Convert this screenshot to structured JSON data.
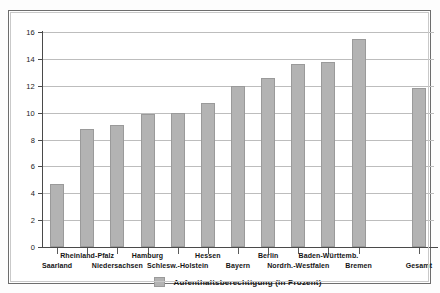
{
  "chart_data": {
    "type": "bar",
    "title": "",
    "subtitle": "",
    "xlabel": "",
    "ylabel": "",
    "ylim": [
      0,
      16
    ],
    "ytick_step": 2,
    "yticks": [
      0,
      2,
      4,
      6,
      8,
      10,
      12,
      14,
      16
    ],
    "grid": true,
    "legend_position": "bottom",
    "legend": [
      "Aufenthaltsberechtigung (in Prozent)"
    ],
    "series_color": "#b3b3b3",
    "categories": [
      "Saarland",
      "Rheinland-Pfalz",
      "Niedersachsen",
      "Hamburg",
      "Schlesw.-Holstein",
      "Hessen",
      "Bayern",
      "Berlin",
      "Nordrh.-Westfalen",
      "Baden-Württemb.",
      "Bremen",
      "Gesamt"
    ],
    "values": [
      4.7,
      8.8,
      9.1,
      9.9,
      10.0,
      10.7,
      12.0,
      12.6,
      13.6,
      13.8,
      15.5,
      11.8
    ],
    "series": [
      {
        "name": "Aufenthaltsberechtigung (in Prozent)",
        "values": [
          4.7,
          8.8,
          9.1,
          9.9,
          10.0,
          10.7,
          12.0,
          12.6,
          13.6,
          13.8,
          15.5,
          11.8
        ]
      }
    ],
    "label_rows": [
      1,
      0,
      1,
      0,
      1,
      0,
      1,
      0,
      1,
      0,
      1,
      1
    ],
    "gap_before_last": true
  }
}
